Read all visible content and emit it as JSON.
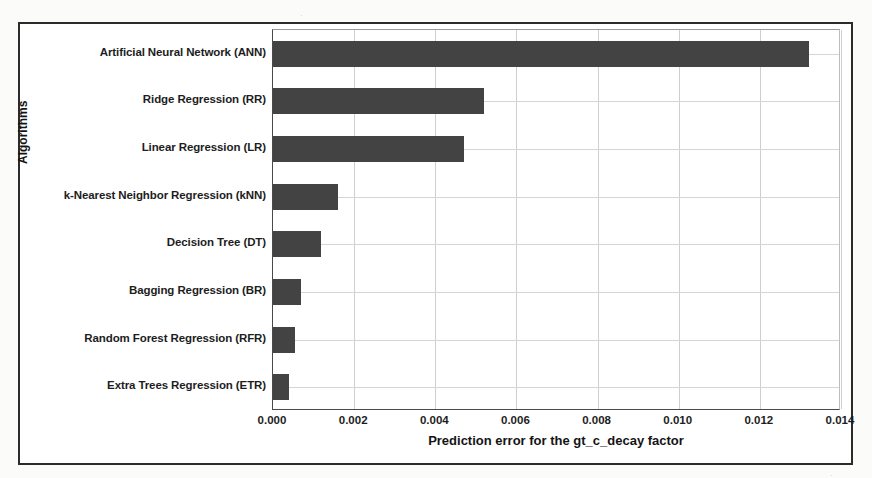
{
  "chart_data": {
    "type": "bar",
    "orientation": "horizontal",
    "title": "",
    "xlabel": "Prediction error for the gt_c_decay factor",
    "ylabel": "Algorithms",
    "categories": [
      "Artificial Neural Network (ANN)",
      "Ridge Regression (RR)",
      "Linear Regression (LR)",
      "k-Nearest Neighbor Regression (kNN)",
      "Decision Tree (DT)",
      "Bagging Regression (BR)",
      "Random Forest Regression (RFR)",
      "Extra Trees Regression (ETR)"
    ],
    "values": [
      0.0132,
      0.0052,
      0.0047,
      0.0016,
      0.00118,
      0.0007,
      0.00055,
      0.0004
    ],
    "xlim": [
      0.0,
      0.014
    ],
    "xticks": [
      0.0,
      0.002,
      0.004,
      0.006,
      0.008,
      0.01,
      0.012,
      0.014
    ],
    "xtick_labels": [
      "0.000",
      "0.002",
      "0.004",
      "0.006",
      "0.008",
      "0.010",
      "0.012",
      "0.014"
    ],
    "grid": true,
    "grid_axis": "both",
    "legend": "none",
    "bar_color": "#434343",
    "background_color": "#ffffff"
  },
  "figure": {
    "border_color": "#2b2b2b",
    "axis_color": "#4a4a4a",
    "gridline_color": "#cfcfcf"
  },
  "artifacts": {
    "marks": [
      "'∘",
      "·",
      "˙",
      "·",
      "˜"
    ]
  }
}
